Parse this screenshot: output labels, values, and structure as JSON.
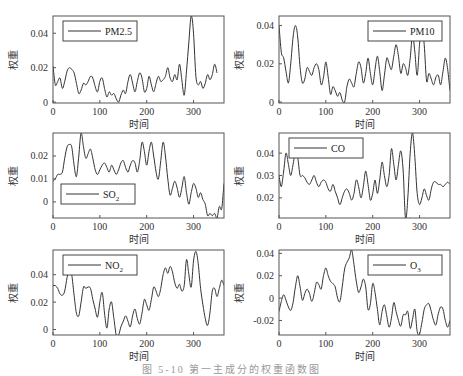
{
  "figure": {
    "caption": "图 5-10  第一主成分的权重函数图"
  },
  "chart_data": [
    {
      "type": "line",
      "title": "",
      "legend": "PM2.5",
      "legend_position": "upper-left",
      "xlabel": "时间",
      "ylabel": "权重",
      "xlim": [
        0,
        365
      ],
      "ylim": [
        -0.0005,
        0.05
      ],
      "xticks": [
        0,
        100,
        200,
        300
      ],
      "yticks": [
        0,
        0.02,
        0.04
      ],
      "ytick_labels": [
        "0",
        "0.02",
        "0.04"
      ],
      "grid": false,
      "x": [
        0,
        5,
        10,
        15,
        20,
        25,
        30,
        35,
        40,
        45,
        50,
        55,
        60,
        65,
        70,
        75,
        80,
        85,
        90,
        95,
        100,
        105,
        110,
        115,
        120,
        125,
        130,
        135,
        140,
        145,
        150,
        155,
        160,
        165,
        170,
        175,
        180,
        185,
        190,
        195,
        200,
        205,
        210,
        215,
        220,
        225,
        230,
        235,
        240,
        245,
        250,
        255,
        260,
        265,
        270,
        275,
        280,
        285,
        290,
        295,
        300,
        305,
        310,
        315,
        320,
        325,
        330,
        335,
        340,
        345,
        350,
        355,
        360,
        365
      ],
      "values": [
        0.021,
        0.01,
        0.012,
        0.014,
        0.008,
        0.012,
        0.018,
        0.02,
        0.019,
        0.017,
        0.011,
        0.005,
        0.007,
        0.011,
        0.01,
        0.012,
        0.015,
        0.014,
        0.009,
        0.006,
        0.012,
        0.014,
        0.008,
        0.003,
        0.006,
        0.004,
        0.005,
        0.002,
        0.0,
        0.004,
        0.007,
        0.005,
        0.012,
        0.016,
        0.011,
        0.006,
        0.012,
        0.017,
        0.014,
        0.006,
        0.008,
        0.015,
        0.01,
        0.006,
        0.011,
        0.015,
        0.012,
        0.013,
        0.015,
        0.02,
        0.014,
        0.012,
        0.016,
        0.013,
        0.022,
        0.013,
        0.004,
        0.018,
        0.035,
        0.05,
        0.04,
        0.015,
        0.01,
        0.012,
        0.008,
        0.011,
        0.016,
        0.013,
        0.016,
        0.022,
        0.017,
        0.009
      ]
    },
    {
      "type": "line",
      "title": "",
      "legend": "PM10",
      "legend_position": "upper-right",
      "xlabel": "时间",
      "ylabel": "权重",
      "xlim": [
        0,
        365
      ],
      "ylim": [
        -0.0005,
        0.045
      ],
      "xticks": [
        0,
        100,
        200,
        300
      ],
      "yticks": [
        0,
        0.02,
        0.04
      ],
      "ytick_labels": [
        "0",
        "0.02",
        "0.04"
      ],
      "grid": false,
      "x": [
        0,
        5,
        10,
        15,
        20,
        25,
        30,
        35,
        40,
        45,
        50,
        55,
        60,
        65,
        70,
        75,
        80,
        85,
        90,
        95,
        100,
        105,
        110,
        115,
        120,
        125,
        130,
        135,
        140,
        145,
        150,
        155,
        160,
        165,
        170,
        175,
        180,
        185,
        190,
        195,
        200,
        205,
        210,
        215,
        220,
        225,
        230,
        235,
        240,
        245,
        250,
        255,
        260,
        265,
        270,
        275,
        280,
        285,
        290,
        295,
        300,
        305,
        310,
        315,
        320,
        325,
        330,
        335,
        340,
        345,
        350,
        355,
        360,
        365
      ],
      "values": [
        0.04,
        0.026,
        0.023,
        0.016,
        0.01,
        0.02,
        0.034,
        0.04,
        0.034,
        0.018,
        0.01,
        0.012,
        0.018,
        0.016,
        0.014,
        0.018,
        0.02,
        0.017,
        0.009,
        0.013,
        0.021,
        0.013,
        0.004,
        0.008,
        0.006,
        0.003,
        0.005,
        0.001,
        0.0,
        0.008,
        0.012,
        0.01,
        0.008,
        0.015,
        0.021,
        0.018,
        0.01,
        0.015,
        0.023,
        0.015,
        0.009,
        0.017,
        0.024,
        0.016,
        0.006,
        0.014,
        0.023,
        0.02,
        0.017,
        0.024,
        0.03,
        0.024,
        0.015,
        0.02,
        0.018,
        0.014,
        0.023,
        0.035,
        0.026,
        0.014,
        0.03,
        0.041,
        0.03,
        0.011,
        0.015,
        0.012,
        0.009,
        0.013,
        0.014,
        0.009,
        0.016,
        0.023,
        0.017,
        0.006
      ]
    },
    {
      "type": "line",
      "title": "",
      "legend": "SO2",
      "legend_position": "lower-left",
      "xlabel": "时间",
      "ylabel": "权重",
      "xlim": [
        0,
        365
      ],
      "ylim": [
        -0.007,
        0.03
      ],
      "xticks": [
        0,
        100,
        200,
        300
      ],
      "yticks": [
        0,
        0.01,
        0.02
      ],
      "ytick_labels": [
        "0",
        "0.01",
        "0.02"
      ],
      "grid": false,
      "x": [
        0,
        5,
        10,
        15,
        20,
        25,
        30,
        35,
        40,
        45,
        50,
        55,
        60,
        65,
        70,
        75,
        80,
        85,
        90,
        95,
        100,
        105,
        110,
        115,
        120,
        125,
        130,
        135,
        140,
        145,
        150,
        155,
        160,
        165,
        170,
        175,
        180,
        185,
        190,
        195,
        200,
        205,
        210,
        215,
        220,
        225,
        230,
        235,
        240,
        245,
        250,
        255,
        260,
        265,
        270,
        275,
        280,
        285,
        290,
        295,
        300,
        305,
        310,
        315,
        320,
        325,
        330,
        335,
        340,
        345,
        350,
        355,
        360,
        365
      ],
      "values": [
        0.009,
        0.01,
        0.012,
        0.012,
        0.013,
        0.019,
        0.024,
        0.025,
        0.024,
        0.016,
        0.011,
        0.02,
        0.03,
        0.024,
        0.019,
        0.021,
        0.023,
        0.019,
        0.014,
        0.012,
        0.014,
        0.016,
        0.017,
        0.015,
        0.013,
        0.016,
        0.014,
        0.012,
        0.014,
        0.017,
        0.018,
        0.015,
        0.013,
        0.016,
        0.018,
        0.017,
        0.013,
        0.018,
        0.026,
        0.022,
        0.016,
        0.022,
        0.026,
        0.02,
        0.013,
        0.01,
        0.018,
        0.026,
        0.02,
        0.01,
        0.003,
        0.006,
        0.009,
        0.006,
        0.002,
        0.006,
        0.011,
        0.004,
        -0.001,
        0.004,
        0.008,
        0.006,
        0.002,
        0.004,
        0.001,
        -0.001,
        -0.006,
        -0.005,
        -0.006,
        -0.005,
        -0.007,
        -0.002,
        -0.003,
        0.008
      ]
    },
    {
      "type": "line",
      "title": "",
      "legend": "CO",
      "legend_position": "upper-left",
      "xlabel": "时间",
      "ylabel": "权重",
      "xlim": [
        0,
        365
      ],
      "ylim": [
        0.011,
        0.049
      ],
      "xticks": [
        0,
        100,
        200,
        300
      ],
      "yticks": [
        0.02,
        0.03,
        0.04
      ],
      "ytick_labels": [
        "0.02",
        "0.03",
        "0.04"
      ],
      "grid": false,
      "x": [
        0,
        5,
        10,
        15,
        20,
        25,
        30,
        35,
        40,
        45,
        50,
        55,
        60,
        65,
        70,
        75,
        80,
        85,
        90,
        95,
        100,
        105,
        110,
        115,
        120,
        125,
        130,
        135,
        140,
        145,
        150,
        155,
        160,
        165,
        170,
        175,
        180,
        185,
        190,
        195,
        200,
        205,
        210,
        215,
        220,
        225,
        230,
        235,
        240,
        245,
        250,
        255,
        260,
        265,
        270,
        275,
        280,
        285,
        290,
        295,
        300,
        305,
        310,
        315,
        320,
        325,
        330,
        335,
        340,
        345,
        350,
        355,
        360,
        365
      ],
      "values": [
        0.03,
        0.025,
        0.032,
        0.04,
        0.035,
        0.03,
        0.035,
        0.04,
        0.038,
        0.03,
        0.03,
        0.029,
        0.027,
        0.026,
        0.028,
        0.03,
        0.027,
        0.025,
        0.027,
        0.028,
        0.027,
        0.024,
        0.023,
        0.026,
        0.023,
        0.02,
        0.017,
        0.02,
        0.023,
        0.024,
        0.022,
        0.019,
        0.022,
        0.028,
        0.025,
        0.02,
        0.025,
        0.032,
        0.026,
        0.019,
        0.022,
        0.028,
        0.022,
        0.028,
        0.036,
        0.03,
        0.025,
        0.03,
        0.042,
        0.035,
        0.028,
        0.035,
        0.041,
        0.032,
        0.011,
        0.02,
        0.04,
        0.049,
        0.038,
        0.022,
        0.017,
        0.02,
        0.024,
        0.021,
        0.019,
        0.024,
        0.027,
        0.027,
        0.026,
        0.026,
        0.025,
        0.026,
        0.027,
        0.026
      ]
    },
    {
      "type": "line",
      "title": "",
      "legend": "NO2",
      "legend_position": "upper-left",
      "xlabel": "时间",
      "ylabel": "权重",
      "xlim": [
        0,
        365
      ],
      "ylim": [
        -0.004,
        0.058
      ],
      "xticks": [
        0,
        100,
        200,
        300
      ],
      "yticks": [
        0,
        0.02,
        0.04
      ],
      "ytick_labels": [
        "0",
        "0.02",
        "0.04"
      ],
      "grid": false,
      "x": [
        0,
        5,
        10,
        15,
        20,
        25,
        30,
        35,
        40,
        45,
        50,
        55,
        60,
        65,
        70,
        75,
        80,
        85,
        90,
        95,
        100,
        105,
        110,
        115,
        120,
        125,
        130,
        135,
        140,
        145,
        150,
        155,
        160,
        165,
        170,
        175,
        180,
        185,
        190,
        195,
        200,
        205,
        210,
        215,
        220,
        225,
        230,
        235,
        240,
        245,
        250,
        255,
        260,
        265,
        270,
        275,
        280,
        285,
        290,
        295,
        300,
        305,
        310,
        315,
        320,
        325,
        330,
        335,
        340,
        345,
        350,
        355,
        360,
        365
      ],
      "values": [
        0.032,
        0.032,
        0.03,
        0.026,
        0.025,
        0.028,
        0.038,
        0.044,
        0.04,
        0.025,
        0.012,
        0.01,
        0.02,
        0.031,
        0.03,
        0.031,
        0.03,
        0.022,
        0.015,
        0.009,
        0.02,
        0.027,
        0.012,
        0.001,
        0.015,
        0.02,
        0.008,
        -0.004,
        -0.004,
        0.002,
        0.006,
        0.01,
        0.006,
        0.002,
        0.01,
        0.015,
        0.008,
        0.004,
        0.012,
        0.022,
        0.018,
        0.014,
        0.022,
        0.031,
        0.028,
        0.024,
        0.03,
        0.04,
        0.045,
        0.041,
        0.046,
        0.042,
        0.034,
        0.03,
        0.033,
        0.028,
        0.032,
        0.051,
        0.04,
        0.031,
        0.05,
        0.057,
        0.048,
        0.03,
        0.018,
        0.008,
        0.003,
        0.012,
        0.028,
        0.03,
        0.024,
        0.03,
        0.036,
        0.032
      ]
    },
    {
      "type": "line",
      "title": "",
      "legend": "O3",
      "legend_position": "upper-right",
      "xlabel": "时间",
      "ylabel": "权重",
      "xlim": [
        0,
        365
      ],
      "ylim": [
        -0.033,
        0.043
      ],
      "xticks": [
        0,
        100,
        200,
        300
      ],
      "yticks": [
        -0.02,
        0,
        0.02,
        0.04
      ],
      "ytick_labels": [
        "-0.02",
        "0",
        "0.02",
        "0.04"
      ],
      "grid": false,
      "x": [
        0,
        5,
        10,
        15,
        20,
        25,
        30,
        35,
        40,
        45,
        50,
        55,
        60,
        65,
        70,
        75,
        80,
        85,
        90,
        95,
        100,
        105,
        110,
        115,
        120,
        125,
        130,
        135,
        140,
        145,
        150,
        155,
        160,
        165,
        170,
        175,
        180,
        185,
        190,
        195,
        200,
        205,
        210,
        215,
        220,
        225,
        230,
        235,
        240,
        245,
        250,
        255,
        260,
        265,
        270,
        275,
        280,
        285,
        290,
        295,
        300,
        305,
        310,
        315,
        320,
        325,
        330,
        335,
        340,
        345,
        350,
        355,
        360,
        365
      ],
      "values": [
        -0.012,
        -0.003,
        0.003,
        -0.002,
        -0.008,
        -0.011,
        -0.004,
        0.01,
        0.02,
        0.01,
        -0.002,
        0.004,
        0.008,
        0.004,
        -0.003,
        0.004,
        0.014,
        0.012,
        0.008,
        0.02,
        0.027,
        0.02,
        0.015,
        0.013,
        0.01,
        0.0,
        -0.003,
        0.01,
        0.026,
        0.032,
        0.036,
        0.043,
        0.03,
        0.015,
        0.005,
        0.01,
        0.017,
        0.01,
        -0.01,
        -0.005,
        0.013,
        0.005,
        -0.01,
        -0.024,
        -0.012,
        -0.006,
        -0.016,
        -0.026,
        -0.018,
        -0.004,
        -0.012,
        -0.02,
        -0.025,
        -0.015,
        -0.015,
        -0.012,
        -0.027,
        -0.019,
        -0.01,
        -0.03,
        -0.032,
        -0.022,
        -0.01,
        -0.006,
        -0.005,
        -0.012,
        -0.02,
        -0.024,
        -0.014,
        -0.008,
        -0.01,
        -0.02,
        -0.026,
        -0.02
      ]
    }
  ]
}
